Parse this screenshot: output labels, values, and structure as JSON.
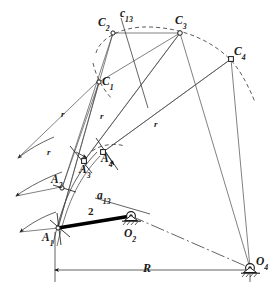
{
  "figure": {
    "type": "kinematic-synthesis-diagram",
    "background_color": "#ffffff",
    "line_color": "#3b3b3b",
    "bold_line_color": "#000000",
    "dashed_color": "#4a4a4a"
  },
  "labels": {
    "c13": {
      "base": "c",
      "sub": "13"
    },
    "a13": {
      "base": "a",
      "sub": "13"
    },
    "C1": {
      "base": "C",
      "sub": "1"
    },
    "C2": {
      "base": "C",
      "sub": "2"
    },
    "C3": {
      "base": "C",
      "sub": "3"
    },
    "C4": {
      "base": "C",
      "sub": "4"
    },
    "A1": {
      "base": "A",
      "sub": "1"
    },
    "A2": {
      "base": "A",
      "sub": "2"
    },
    "A3": {
      "base": "A",
      "sub": "3"
    },
    "A4": {
      "base": "A",
      "sub": "4"
    },
    "O2": {
      "base": "O",
      "sub": "2"
    },
    "O4": {
      "base": "O",
      "sub": "4"
    },
    "link2": "2",
    "R": "R",
    "r1": "r",
    "r2": "r",
    "r3": "r",
    "r4": "r"
  },
  "points": {
    "A1": {
      "x": 58,
      "y": 228,
      "label": "A1"
    },
    "A2": {
      "x": 62,
      "y": 188,
      "label": "A2"
    },
    "A3": {
      "x": 84,
      "y": 161,
      "label": "A3"
    },
    "A4": {
      "x": 103,
      "y": 152,
      "label": "A4"
    },
    "C1": {
      "x": 99,
      "y": 82,
      "label": "C1"
    },
    "C2": {
      "x": 113,
      "y": 33,
      "label": "C2"
    },
    "C3": {
      "x": 180,
      "y": 33,
      "label": "C3"
    },
    "C4": {
      "x": 231,
      "y": 59,
      "label": "C4"
    },
    "O2": {
      "x": 131,
      "y": 216,
      "label": "O2"
    },
    "O4": {
      "x": 250,
      "y": 268,
      "label": "O4"
    }
  },
  "dimension": {
    "R_line_y": 270,
    "R_from_x": 55,
    "R_to_x": 250,
    "R_label": "R"
  }
}
